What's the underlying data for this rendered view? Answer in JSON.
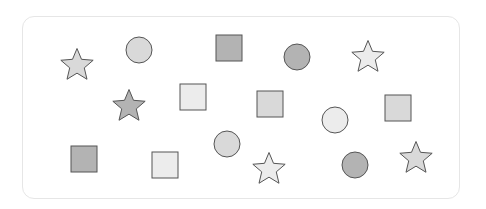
{
  "palette": {
    "dark": "#b3b3b3",
    "light": "#d9d9d9",
    "very_light": "#ececec",
    "stroke": "#555555",
    "panel_border": "#e6e6e6"
  },
  "shapes": [
    {
      "type": "star",
      "shade": "light",
      "cx": 77,
      "cy": 64,
      "size": 34
    },
    {
      "type": "circle",
      "shade": "light",
      "cx": 139,
      "cy": 50,
      "size": 26
    },
    {
      "type": "square",
      "shade": "dark",
      "cx": 229,
      "cy": 48,
      "size": 26
    },
    {
      "type": "circle",
      "shade": "dark",
      "cx": 297,
      "cy": 57,
      "size": 26
    },
    {
      "type": "star",
      "shade": "very_light",
      "cx": 368,
      "cy": 56,
      "size": 34
    },
    {
      "type": "star",
      "shade": "dark",
      "cx": 129,
      "cy": 105,
      "size": 34
    },
    {
      "type": "square",
      "shade": "very_light",
      "cx": 193,
      "cy": 97,
      "size": 26
    },
    {
      "type": "square",
      "shade": "light",
      "cx": 270,
      "cy": 104,
      "size": 26
    },
    {
      "type": "circle",
      "shade": "very_light",
      "cx": 335,
      "cy": 120,
      "size": 26
    },
    {
      "type": "square",
      "shade": "light",
      "cx": 398,
      "cy": 108,
      "size": 26
    },
    {
      "type": "square",
      "shade": "dark",
      "cx": 84,
      "cy": 159,
      "size": 26
    },
    {
      "type": "square",
      "shade": "very_light",
      "cx": 165,
      "cy": 165,
      "size": 26
    },
    {
      "type": "circle",
      "shade": "light",
      "cx": 227,
      "cy": 144,
      "size": 26
    },
    {
      "type": "star",
      "shade": "very_light",
      "cx": 269,
      "cy": 168,
      "size": 34
    },
    {
      "type": "circle",
      "shade": "dark",
      "cx": 355,
      "cy": 165,
      "size": 26
    },
    {
      "type": "star",
      "shade": "light",
      "cx": 416,
      "cy": 157,
      "size": 34
    }
  ]
}
